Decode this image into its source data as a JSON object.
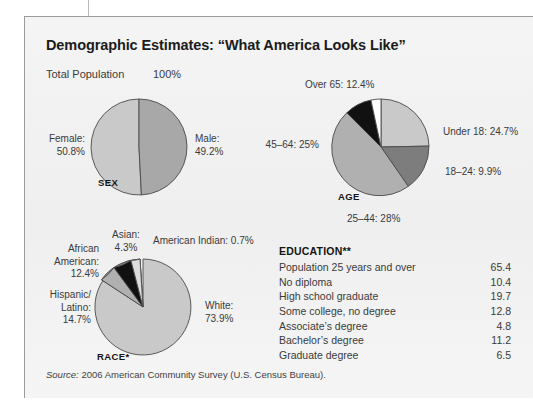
{
  "figure": {
    "title": "Demographic Estimates: “What America Looks Like”",
    "total_population_label": "Total Population",
    "total_population_value": "100%",
    "source_prefix": "Source:",
    "source_text": "2006 American Community Survey (U.S. Census Bureau)."
  },
  "colors": {
    "panel_bg": "#f2f2f2",
    "panel_border": "#9b9b9b",
    "ink": "#1b1b1b",
    "light_gray": "#c9c9c9",
    "mid_gray": "#b0b0b0",
    "dark_gray": "#7d7d7d",
    "black": "#111111",
    "white": "#ffffff",
    "stroke": "#4a4a4a"
  },
  "charts": {
    "sex": {
      "caption": "SEX",
      "labels": {
        "female": "Female:\n50.8%",
        "female_line1": "Female:",
        "female_line2": "50.8%",
        "male_line1": "Male:",
        "male_line2": "49.2%"
      }
    },
    "age": {
      "caption": "AGE",
      "labels": {
        "over65": "Over 65: 12.4%",
        "under18": "Under 18: 24.7%",
        "a18_24": "18–24: 9.9%",
        "a25_44": "25–44: 28%",
        "a45_64": "45–64: 25%"
      }
    },
    "race": {
      "caption": "RACE*",
      "labels": {
        "asian_line1": "Asian:",
        "asian_line2": "4.3%",
        "amerindian": "American Indian: 0.7%",
        "african_line1": "African",
        "african_line2": "American:",
        "african_line3": "12.4%",
        "hispanic_line1": "Hispanic/",
        "hispanic_line2": "Latino:",
        "hispanic_line3": "14.7%",
        "white_line1": "White:",
        "white_line2": "73.9%"
      }
    }
  },
  "education": {
    "title": "EDUCATION**",
    "rows": [
      {
        "label": "Population 25 years and over",
        "value": "65.4"
      },
      {
        "label": "No diploma",
        "value": "10.4"
      },
      {
        "label": "High school graduate",
        "value": "19.7"
      },
      {
        "label": "Some college, no degree",
        "value": "12.8"
      },
      {
        "label": "Associate’s degree",
        "value": "4.8"
      },
      {
        "label": "Bachelor’s degree",
        "value": "11.2"
      },
      {
        "label": "Graduate degree",
        "value": "6.5"
      }
    ]
  },
  "chart_data": [
    {
      "type": "pie",
      "title": "SEX",
      "categories": [
        "Female",
        "Male"
      ],
      "values": [
        50.8,
        49.2
      ],
      "unit": "percent",
      "colors": [
        "#c9c9c9",
        "#a8a8a8"
      ],
      "start_angle_deg": 0,
      "direction": "counterclockwise",
      "labels": [
        "Female: 50.8%",
        "Male: 49.2%"
      ]
    },
    {
      "type": "pie",
      "title": "AGE",
      "categories": [
        "Under 18",
        "18–24",
        "25–44",
        "45–64",
        "Over 65"
      ],
      "values": [
        24.7,
        9.9,
        28,
        25,
        12.4
      ],
      "unit": "percent",
      "colors": [
        "#c9c9c9",
        "#7d7d7d",
        "#b0b0b0",
        "#111111",
        "#ffffff"
      ],
      "start_angle_deg": 0,
      "direction": "clockwise",
      "labels": [
        "Under 18: 24.7%",
        "18–24: 9.9%",
        "25–44: 28%",
        "45–64: 25%",
        "Over 65: 12.4%"
      ]
    },
    {
      "type": "pie",
      "title": "RACE*",
      "categories": [
        "White",
        "Hispanic/Latino",
        "African American",
        "Asian",
        "American Indian"
      ],
      "values": [
        73.9,
        14.7,
        12.4,
        4.3,
        0.7
      ],
      "unit": "percent",
      "colors": [
        "#c9c9c9",
        "#8a8a8a",
        "#b0b0b0",
        "#111111",
        "#dcdcdc"
      ],
      "start_angle_deg": 0,
      "direction": "clockwise",
      "labels": [
        "White: 73.9%",
        "Hispanic/Latino: 14.7%",
        "African American: 12.4%",
        "Asian: 4.3%",
        "American Indian: 0.7%"
      ]
    },
    {
      "type": "table",
      "title": "EDUCATION**",
      "categories": [
        "Population 25 years and over",
        "No diploma",
        "High school graduate",
        "Some college, no degree",
        "Associate’s degree",
        "Bachelor’s degree",
        "Graduate degree"
      ],
      "values": [
        65.4,
        10.4,
        19.7,
        12.8,
        4.8,
        11.2,
        6.5
      ],
      "unit": "percent"
    }
  ]
}
